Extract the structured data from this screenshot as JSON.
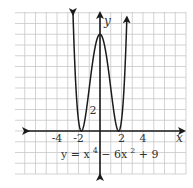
{
  "chart_data": {
    "type": "line",
    "title": "",
    "equation": "y = x⁴ − 6x² + 9",
    "equation_parts": {
      "lhs": "y = x",
      "exp1": "4",
      "mid": " − 6x",
      "exp2": "2",
      "rhs": " + 9"
    },
    "xlabel": "x",
    "ylabel": "y",
    "x_tick_labels": [
      "-4",
      "-2",
      "2",
      "4"
    ],
    "x_ticks": [
      -4,
      -2,
      2,
      4
    ],
    "y_tick_labels": [
      "2"
    ],
    "y_ticks": [
      2
    ],
    "xlim": [
      -8,
      8
    ],
    "ylim": [
      -4,
      11
    ],
    "grid": true,
    "grid_step": 1,
    "legend": null,
    "series": [
      {
        "name": "y = x^4 - 6x^2 + 9",
        "function": "x^4 - 6x^2 + 9",
        "x": [
          -2.5,
          -2,
          -1.732,
          -1,
          0,
          1,
          1.732,
          2,
          2.5
        ],
        "y": [
          10.6,
          1,
          0,
          4,
          9,
          4,
          0,
          1,
          10.6
        ],
        "arrows_at_ends": true
      }
    ],
    "key_points": [
      {
        "label": "local max",
        "x": 0,
        "y": 9
      },
      {
        "label": "minimum",
        "x": -1.732,
        "y": 0
      },
      {
        "label": "minimum",
        "x": 1.732,
        "y": 0
      }
    ],
    "colors": {
      "grid": "#c8c8c8",
      "axes": "#1a1a1a",
      "curve": "#1a1a1a",
      "text": "#333333"
    }
  }
}
